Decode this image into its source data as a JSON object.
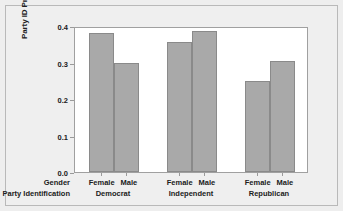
{
  "chart_data": {
    "type": "bar",
    "title": "",
    "subtitle": "",
    "xlabel": "Party Identification",
    "ylabel": "Party ID Proportion",
    "ylim": [
      0.0,
      0.4
    ],
    "ytick_labels": [
      "0.0",
      "0.1",
      "0.2",
      "0.3",
      "0.4"
    ],
    "ytick_values": [
      0.0,
      0.1,
      0.2,
      0.3,
      0.4
    ],
    "grid": false,
    "legend": false,
    "legend_position": "none",
    "group_axis_label": "Party Identification",
    "subgroup_axis_label": "Gender",
    "categories": [
      "Democrat",
      "Independent",
      "Republican"
    ],
    "subgroups": [
      "Female",
      "Male"
    ],
    "series": [
      {
        "name": "Female",
        "values": [
          0.38,
          0.355,
          0.25
        ]
      },
      {
        "name": "Male",
        "values": [
          0.3,
          0.385,
          0.305
        ]
      }
    ],
    "bars": [
      {
        "group": "Democrat",
        "subgroup": "Female",
        "value": 0.38
      },
      {
        "group": "Democrat",
        "subgroup": "Male",
        "value": 0.3
      },
      {
        "group": "Independent",
        "subgroup": "Female",
        "value": 0.355
      },
      {
        "group": "Independent",
        "subgroup": "Male",
        "value": 0.385
      },
      {
        "group": "Republican",
        "subgroup": "Female",
        "value": 0.25
      },
      {
        "group": "Republican",
        "subgroup": "Male",
        "value": 0.305
      }
    ],
    "bar_color": "#a9a9a9",
    "bar_edge_color": "#8a8a8a",
    "plot_background": "#ffffff",
    "figure_background": "#efefef",
    "axis_color": "#a0a0a0"
  },
  "axis": {
    "y_title": "Party ID Proportion",
    "ticks": [
      "0.4",
      "0.3",
      "0.2",
      "0.1",
      "0.0"
    ]
  },
  "row_headers": {
    "gender": "Gender",
    "party": "Party Identification"
  },
  "groups": [
    {
      "female": "Female",
      "male": "Male",
      "party": "Democrat"
    },
    {
      "female": "Female",
      "male": "Male",
      "party": "Independent"
    },
    {
      "female": "Female",
      "male": "Male",
      "party": "Republican"
    }
  ]
}
